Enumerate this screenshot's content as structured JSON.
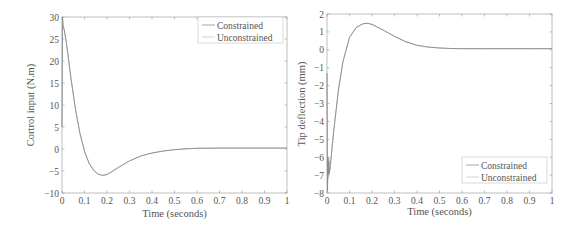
{
  "chart_data": [
    {
      "type": "line",
      "title": "",
      "xlabel": "Time (seconds)",
      "ylabel": "Cortrol input (N.m)",
      "xlim": [
        0,
        1
      ],
      "ylim": [
        -10,
        30
      ],
      "xticks": [
        "0",
        "0.1",
        "0.2",
        "0.3",
        "0.4",
        "0.5",
        "0.6",
        "0.7",
        "0.8",
        "0.9",
        "1"
      ],
      "yticks": [
        "30",
        "25",
        "20",
        "15",
        "10",
        "5",
        "0",
        "−5",
        "−10"
      ],
      "grid": false,
      "legend_position": "upper right",
      "x": [
        0,
        0.002,
        0.005,
        0.01,
        0.02,
        0.04,
        0.06,
        0.08,
        0.1,
        0.12,
        0.14,
        0.16,
        0.18,
        0.2,
        0.22,
        0.25,
        0.3,
        0.35,
        0.4,
        0.45,
        0.5,
        0.55,
        0.6,
        0.7,
        0.8,
        0.9,
        1.0
      ],
      "series": [
        {
          "name": "Constrained",
          "color": "#8a8a8a",
          "values": [
            5,
            30,
            28,
            27,
            24,
            16,
            9,
            3.5,
            -0.5,
            -3.2,
            -4.8,
            -5.7,
            -6.0,
            -5.8,
            -5.2,
            -4.2,
            -2.7,
            -1.6,
            -0.9,
            -0.45,
            -0.15,
            0.05,
            0.15,
            0.2,
            0.2,
            0.2,
            0.2
          ]
        },
        {
          "name": "Unconstrained",
          "color": "#c8c8c8",
          "values": [
            5,
            30,
            28,
            27,
            24,
            16,
            9,
            3.5,
            -0.5,
            -3.2,
            -4.8,
            -5.7,
            -6.0,
            -5.8,
            -5.2,
            -4.2,
            -2.7,
            -1.6,
            -0.9,
            -0.45,
            -0.15,
            0.05,
            0.15,
            0.2,
            0.2,
            0.2,
            0.2
          ]
        }
      ]
    },
    {
      "type": "line",
      "title": "",
      "xlabel": "Time (seconds)",
      "ylabel": "Tip deflection (mm)",
      "xlim": [
        0,
        1
      ],
      "ylim": [
        -8,
        2
      ],
      "xticks": [
        "0",
        "0.1",
        "0.2",
        "0.3",
        "0.4",
        "0.5",
        "0.6",
        "0.7",
        "0.8",
        "0.9",
        "1"
      ],
      "yticks": [
        "2",
        "1",
        "0",
        "−1",
        "−2",
        "−3",
        "−4",
        "−5",
        "−6",
        "−7",
        "−8"
      ],
      "grid": false,
      "legend_position": "lower right",
      "x": [
        0,
        0.002,
        0.004,
        0.006,
        0.008,
        0.01,
        0.015,
        0.02,
        0.03,
        0.05,
        0.07,
        0.1,
        0.13,
        0.16,
        0.18,
        0.2,
        0.25,
        0.3,
        0.35,
        0.4,
        0.45,
        0.5,
        0.55,
        0.6,
        0.7,
        0.8,
        0.9,
        1.0
      ],
      "series": [
        {
          "name": "Constrained",
          "color": "#8a8a8a",
          "values": [
            -1.3,
            -7.9,
            -6.0,
            -7.0,
            -6.2,
            -6.9,
            -6.5,
            -5.8,
            -4.5,
            -2.3,
            -0.7,
            0.7,
            1.25,
            1.45,
            1.48,
            1.42,
            1.1,
            0.75,
            0.45,
            0.25,
            0.15,
            0.1,
            0.07,
            0.06,
            0.06,
            0.06,
            0.06,
            0.06
          ]
        },
        {
          "name": "Unconstrained",
          "color": "#c8c8c8",
          "values": [
            -1.3,
            -7.6,
            -6.2,
            -7.2,
            -6.0,
            -7.0,
            -6.4,
            -5.8,
            -4.5,
            -2.3,
            -0.7,
            0.7,
            1.25,
            1.45,
            1.48,
            1.42,
            1.1,
            0.75,
            0.45,
            0.25,
            0.15,
            0.1,
            0.07,
            0.06,
            0.06,
            0.06,
            0.06,
            0.06
          ]
        }
      ]
    }
  ]
}
